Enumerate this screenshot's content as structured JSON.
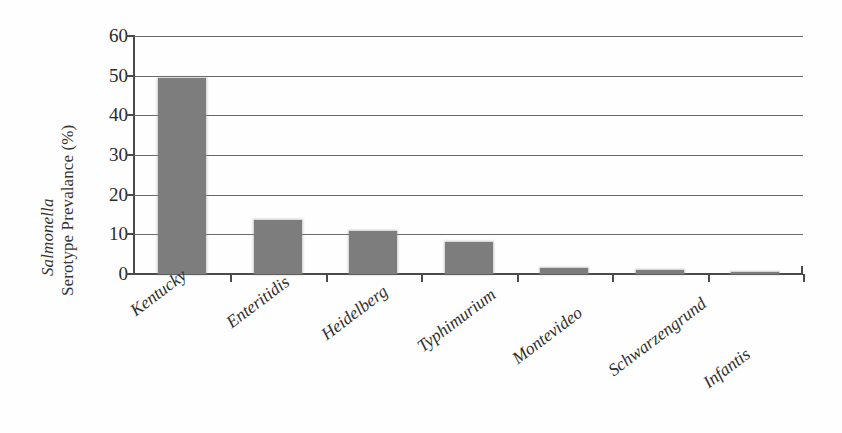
{
  "chart_data": {
    "type": "bar",
    "title": "",
    "xlabel": "",
    "ylabel_line1": "Salmonella",
    "ylabel_line2": "Serotype Prevalance (%)",
    "ylabel_line1_italic": true,
    "categories": [
      "Kentucky",
      "Enteritidis",
      "Heidelberg",
      "Typhimurium",
      "Montevideo",
      "Schwarzengrund",
      "Infantis"
    ],
    "values": [
      49.3,
      13.6,
      10.8,
      8.0,
      1.5,
      0.9,
      0.6
    ],
    "ylim": [
      0,
      60
    ],
    "ytick_labels": [
      "0",
      "10",
      "20",
      "30",
      "40",
      "50",
      "60"
    ],
    "ytick_values": [
      0,
      10,
      20,
      30,
      40,
      50,
      60
    ],
    "grid": true,
    "grid_axis": "y",
    "legend": "none",
    "bar_color": "#7d7d7d",
    "axis_color": "#4a4a4a",
    "gridline_color": "#6a6a6a",
    "background_color": "#fefefe",
    "xtick_label_rotation": -37
  },
  "figure": {
    "plot_left": 133,
    "plot_top": 36,
    "plot_width": 670,
    "plot_height": 238,
    "bar_width": 48,
    "category_step": 95.5,
    "first_bar_left": 25
  }
}
